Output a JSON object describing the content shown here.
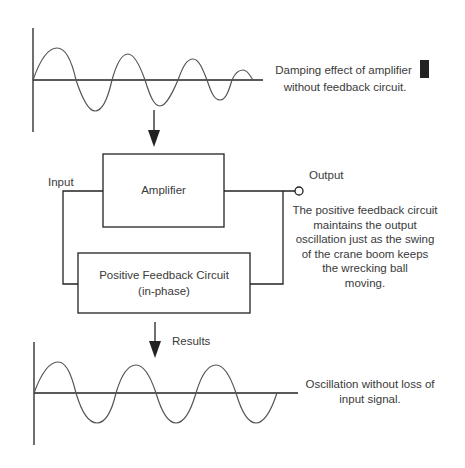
{
  "top_wave": {
    "caption_line1": "Damping effect of amplifier",
    "caption_line2": "without feedback circuit."
  },
  "circuit": {
    "amplifier_label": "Amplifier",
    "input_label": "Input",
    "output_label": "Output",
    "feedback_label_line1": "Positive Feedback Circuit",
    "feedback_label_line2": "(in-phase)",
    "explanation": [
      "The positive feedback circuit",
      "maintains the output",
      "oscillation just as the swing",
      "of the crane boom keeps",
      "the wrecking ball",
      "moving."
    ]
  },
  "results_label": "Results",
  "bottom_wave": {
    "caption_line1": "Oscillation without loss of",
    "caption_line2": "input signal."
  },
  "colors": {
    "line": "#222222",
    "wave": "#555555",
    "text": "#3a3a3a"
  }
}
